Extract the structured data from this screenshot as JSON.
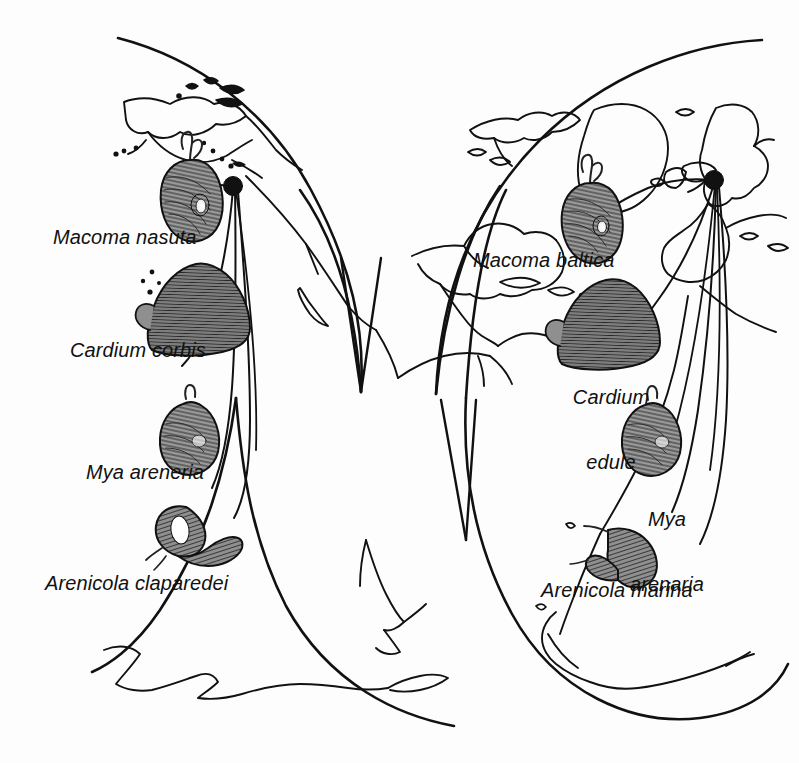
{
  "figure": {
    "background_color": "#fdfdfd",
    "ink_color": "#111111",
    "projection": "interrupted oval (Goode-style), two lobes"
  },
  "hemispheres": {
    "left": {
      "name": "eastern-pacific-lobe",
      "origin_node_label": "Pacific Northwest origin node"
    },
    "right": {
      "name": "eastern-atlantic-lobe",
      "origin_node_label": "North Sea origin node"
    }
  },
  "labels": {
    "left": [
      {
        "id": "macoma-nasuta",
        "text": "Macoma nasuta",
        "lines": [
          "Macoma nasuta"
        ]
      },
      {
        "id": "cardium-corbis",
        "text": "Cardium corbis",
        "lines": [
          "Cardium corbis"
        ]
      },
      {
        "id": "mya-areneria",
        "text": "Mya areneria",
        "lines": [
          "Mya areneria"
        ]
      },
      {
        "id": "arenicola-claparedei",
        "text": "Arenicola claparedei",
        "lines": [
          "Arenicola claparedei"
        ]
      }
    ],
    "right": [
      {
        "id": "macoma-baltica",
        "text": "Macoma baltica",
        "lines": [
          "Macoma baltica"
        ]
      },
      {
        "id": "cardium-edule",
        "text": "Cardium edule",
        "lines": [
          "Cardium",
          "edule"
        ]
      },
      {
        "id": "mya-arenaria",
        "text": "Mya arenaria",
        "lines": [
          "Mya",
          "arenaria"
        ]
      },
      {
        "id": "arenicola-marina",
        "text": "Arenicola marina",
        "lines": [
          "Arenicola marina"
        ]
      }
    ]
  },
  "label_text": {
    "macoma_nasuta": "Macoma nasuta",
    "cardium_corbis": "Cardium corbis",
    "mya_areneria": "Mya areneria",
    "arenicola_claparedei": "Arenicola claparedei",
    "macoma_baltica": "Macoma baltica",
    "cardium_edule_line1": "Cardium",
    "cardium_edule_line2": "edule",
    "mya_arenaria_line1": "Mya",
    "mya_arenaria_line2": "arenaria",
    "arenicola_marina": "Arenicola marina"
  },
  "organisms": [
    {
      "id": "macoma-nasuta-shell",
      "kind": "clam-shell",
      "side": "left",
      "shaded": true
    },
    {
      "id": "cardium-corbis-shell",
      "kind": "cockle-shell",
      "side": "left",
      "shaded": true
    },
    {
      "id": "mya-areneria-shell",
      "kind": "softshell-clam",
      "side": "left",
      "shaded": true
    },
    {
      "id": "arenicola-claparedei-worm",
      "kind": "lugworm",
      "side": "left",
      "shaded": true
    },
    {
      "id": "macoma-baltica-shell",
      "kind": "clam-shell",
      "side": "right",
      "shaded": true
    },
    {
      "id": "cardium-edule-shell",
      "kind": "cockle-shell",
      "side": "right",
      "shaded": true
    },
    {
      "id": "mya-arenaria-shell",
      "kind": "softshell-clam",
      "side": "right",
      "shaded": true
    },
    {
      "id": "arenicola-marina-worm",
      "kind": "lugworm",
      "side": "right",
      "shaded": true
    }
  ],
  "connector_count": {
    "left": 4,
    "right": 4
  }
}
